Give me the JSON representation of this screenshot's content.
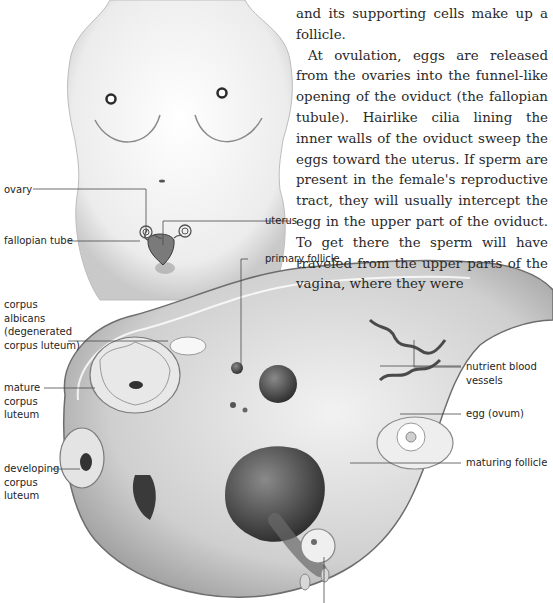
{
  "article": {
    "paragraph_fragment": "and its supporting cells make up a follicle.",
    "paragraph": "At ovulation, eggs are released from the ovaries into the funnel-like opening of the oviduct (the fallopian tubule). Hairlike cilia lining the inner walls of the oviduct sweep the eggs toward the uterus. If sperm are present in the female's reproductive tract, they will usually intercept the egg in the upper part of the oviduct. To get there the sperm will have traveled from the upper parts of the vagina, where they were"
  },
  "figure": {
    "type": "anatomical illustration",
    "labels": {
      "ovary": "ovary",
      "fallopian_tube": "fallopian tube",
      "uterus": "uterus",
      "primary_follicle": "primary follicle",
      "corpus_albicans": "corpus\nalbicans\n(degenerated\ncorpus luteum)",
      "mature_corpus_luteum": "mature\ncorpus\nluteum",
      "developing_corpus_luteum": "developing\ncorpus\nluteum",
      "nutrient_blood_vessels": "nutrient blood\nvessels",
      "egg": "egg (ovum)",
      "maturing_follicle": "maturing follicle"
    }
  }
}
